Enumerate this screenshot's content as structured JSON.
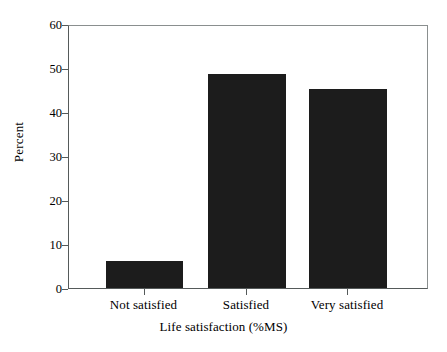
{
  "chart_data": {
    "type": "bar",
    "title": "",
    "xlabel": "Life satisfaction (%MS)",
    "ylabel": "Percent",
    "categories": [
      "Not satisfied",
      "Satisfied",
      "Very satisfied"
    ],
    "values": [
      6.1,
      48.6,
      45.2
    ],
    "ylim": [
      0,
      60
    ],
    "yticks": [
      0,
      10,
      20,
      30,
      40,
      50,
      60
    ],
    "ytick_labels": [
      "0",
      "10",
      "20",
      "30",
      "40",
      "50",
      "60"
    ],
    "grid": false,
    "legend": "none",
    "bar_color": "#1c1c1c",
    "background_color": "#ffffff",
    "axis_color": "#555a5a"
  }
}
